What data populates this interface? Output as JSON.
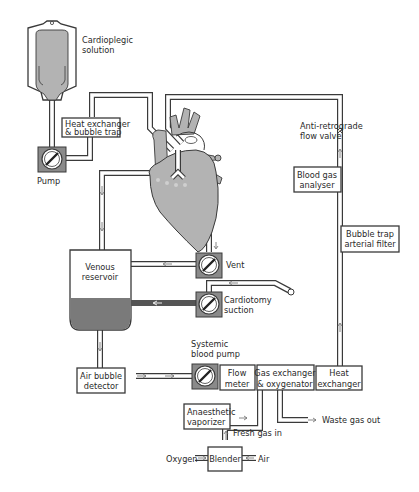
{
  "diagram": {
    "colors": {
      "line": "#3a3a3a",
      "heart_fill": "#b3b3b3",
      "blood_fill": "#7a7a7a",
      "pump_frame": "#8a8a8a",
      "background": "#ffffff"
    },
    "components": {
      "cardioplegic_solution": {
        "label_line1": "Cardioplegic",
        "label_line2": "solution"
      },
      "heat_exchanger_bubble_trap": {
        "label_line1": "Heat exchanger",
        "label_line2": "& bubble trap"
      },
      "pump": {
        "label": "Pump"
      },
      "anti_retrograde_valve": {
        "label_line1": "Anti-retrograde",
        "label_line2": "flow valve"
      },
      "blood_gas_analyser": {
        "label_line1": "Blood gas",
        "label_line2": "analyser"
      },
      "bubble_trap_filter": {
        "label_line1": "Bubble trap",
        "label_line2": "arterial filter"
      },
      "venous_reservoir": {
        "label_line1": "Venous",
        "label_line2": "reservoir"
      },
      "vent": {
        "label": "Vent"
      },
      "cardiotomy_suction": {
        "label_line1": "Cardiotomy",
        "label_line2": "suction"
      },
      "systemic_blood_pump": {
        "label_line1": "Systemic",
        "label_line2": "blood pump"
      },
      "air_bubble_detector": {
        "label_line1": "Air bubble",
        "label_line2": "detector"
      },
      "flow_meter": {
        "label_line1": "Flow",
        "label_line2": "meter"
      },
      "gas_exchanger": {
        "label_line1": "Gas exchanger",
        "label_line2": "& oxygenator"
      },
      "heat_exchanger": {
        "label_line1": "Heat",
        "label_line2": "exchanger"
      },
      "waste_gas": {
        "label": "Waste gas out"
      },
      "anaesthetic_vaporizer": {
        "label_line1": "Anaesthetic",
        "label_line2": "vaporizer"
      },
      "fresh_gas": {
        "label": "Fresh gas in"
      },
      "blender": {
        "label": "Blender"
      },
      "oxygen": {
        "label": "Oxygen"
      },
      "air": {
        "label": "Air"
      }
    }
  }
}
